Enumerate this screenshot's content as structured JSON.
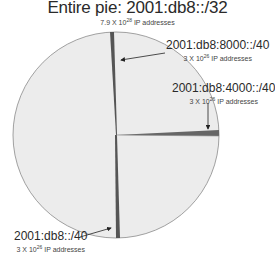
{
  "title": "Entire pie: 2001:db8::/32",
  "subtitle": {
    "mantissa": "7.9 X 10",
    "exponent": "28",
    "suffix": " IP addresses"
  },
  "slices": [
    {
      "prefix": "2001:db8:8000::/40",
      "count_mantissa": "3 X 10",
      "count_exponent": "26",
      "count_suffix": " IP addresses"
    },
    {
      "prefix": "2001:db8:4000::/40",
      "count_mantissa": "3 X 10",
      "count_exponent": "26",
      "count_suffix": " IP addresses"
    },
    {
      "prefix": "2001:db8::/40",
      "count_mantissa": "3 X 10",
      "count_exponent": "26",
      "count_suffix": " IP addresses"
    }
  ],
  "colors": {
    "pie_fill": "#ececec",
    "pie_outline": "#8a8a8a",
    "slice_fill": "#555555",
    "arrow": "#222222"
  }
}
